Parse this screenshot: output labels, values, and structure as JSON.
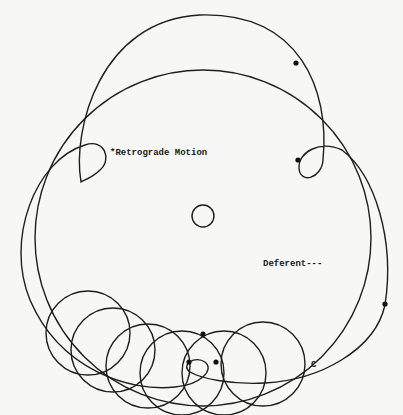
{
  "diagram": {
    "labels": {
      "retrograde": "*Retrograde Motion",
      "deferent": "Deferent---",
      "c_point": "C"
    },
    "colors": {
      "background": "#f7f7f5",
      "ink": "#1e1e1e"
    },
    "elements": {
      "deferent_circle": {
        "cx": 203,
        "cy": 238,
        "r": 168
      },
      "earth_circle": {
        "cx": 203,
        "cy": 216,
        "r": 11
      },
      "epicycle_count": 8,
      "planet_positions": 5
    }
  }
}
